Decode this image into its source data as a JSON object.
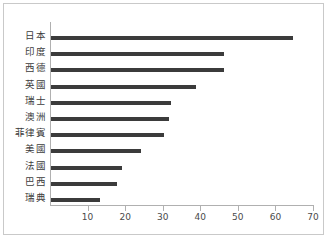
{
  "chart_data": {
    "type": "bar",
    "orientation": "horizontal",
    "title": "",
    "subtitle": "",
    "xlabel": "",
    "ylabel": "",
    "categories": [
      "日本",
      "印度",
      "西德",
      "英國",
      "瑞士",
      "澳洲",
      "菲律賓",
      "美國",
      "法國",
      "巴西",
      "瑞典"
    ],
    "values": [
      64.5,
      46,
      46,
      38.5,
      32,
      31.5,
      30,
      24,
      19,
      17.5,
      13
    ],
    "xlim": [
      0,
      70
    ],
    "xticks": [
      10,
      20,
      30,
      40,
      50,
      60,
      70
    ],
    "xtick_labels": [
      "10",
      "20",
      "30",
      "40",
      "50",
      "60",
      "70"
    ],
    "grid": false,
    "legend": null,
    "bar_color": "#3b3b3b",
    "axis_color": "#b0b0b0",
    "background_color": "#ffffff"
  },
  "figure": {
    "border_color": "#c9c9c9"
  }
}
